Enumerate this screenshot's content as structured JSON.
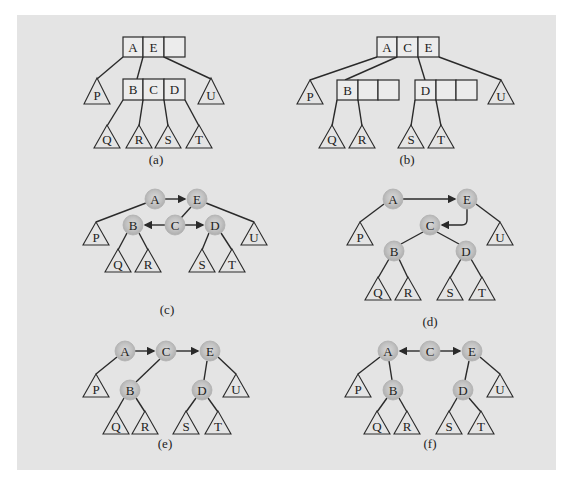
{
  "figure": {
    "background": "#e4e4e4",
    "node_fill": "#bdbdbd",
    "panels": [
      {
        "id": "a",
        "caption": "(a)",
        "type": "b-tree",
        "nodes": [
          {
            "id": "top",
            "keys": [
              "A",
              "E",
              ""
            ]
          },
          {
            "id": "mid",
            "keys": [
              "B",
              "C",
              "D"
            ]
          }
        ],
        "subtrees": [
          "P",
          "Q",
          "R",
          "S",
          "T",
          "U"
        ]
      },
      {
        "id": "b",
        "caption": "(b)",
        "type": "b-tree",
        "nodes": [
          {
            "id": "top",
            "keys": [
              "A",
              "C",
              "E"
            ]
          },
          {
            "id": "left",
            "keys": [
              "B",
              "",
              ""
            ]
          },
          {
            "id": "right",
            "keys": [
              "D",
              "",
              ""
            ]
          }
        ],
        "subtrees": [
          "P",
          "Q",
          "R",
          "S",
          "T",
          "U"
        ]
      },
      {
        "id": "c",
        "caption": "(c)",
        "type": "binary-tree",
        "nodes": [
          "A",
          "E",
          "B",
          "C",
          "D"
        ],
        "subtrees": [
          "P",
          "Q",
          "R",
          "S",
          "T",
          "U"
        ]
      },
      {
        "id": "d",
        "caption": "(d)",
        "type": "binary-tree",
        "nodes": [
          "A",
          "E",
          "C",
          "B",
          "D"
        ],
        "subtrees": [
          "P",
          "Q",
          "R",
          "S",
          "T",
          "U"
        ]
      },
      {
        "id": "e",
        "caption": "(e)",
        "type": "binary-tree",
        "nodes": [
          "A",
          "C",
          "E",
          "B",
          "D"
        ],
        "subtrees": [
          "P",
          "Q",
          "R",
          "S",
          "T",
          "U"
        ]
      },
      {
        "id": "f",
        "caption": "(f)",
        "type": "binary-tree",
        "nodes": [
          "A",
          "C",
          "E",
          "B",
          "D"
        ],
        "subtrees": [
          "P",
          "Q",
          "R",
          "S",
          "T",
          "U"
        ]
      }
    ]
  }
}
